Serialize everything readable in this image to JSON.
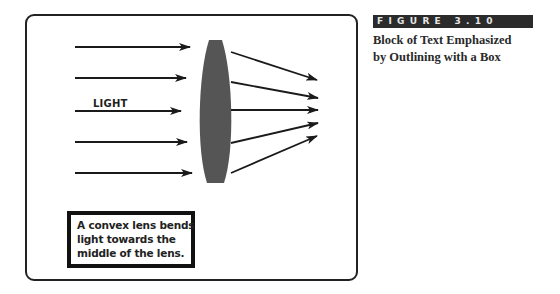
{
  "figure": {
    "label": "FIGURE 3.10",
    "title_lines": [
      "Block of Text Emphasized",
      "by Outlining with a Box"
    ]
  },
  "diagram": {
    "incoming_label": "LIGHT",
    "caption_lines": [
      "A convex lens bends",
      "light towards the",
      "middle of the lens."
    ],
    "colors": {
      "frame": "#222222",
      "lens": "#555555",
      "arrow": "#1a1a1a",
      "label_bar": "#2b2b2b"
    },
    "incoming_rays": [
      {
        "x1": 75,
        "y": 47,
        "x2": 190
      },
      {
        "x1": 75,
        "y": 78,
        "x2": 186
      },
      {
        "x1": 75,
        "y": 111,
        "x2": 181
      },
      {
        "x1": 75,
        "y": 142,
        "x2": 187
      },
      {
        "x1": 75,
        "y": 173,
        "x2": 192
      }
    ],
    "outgoing_rays": [
      {
        "x1": 231,
        "y1": 52,
        "x2": 317,
        "y2": 80
      },
      {
        "x1": 231,
        "y1": 82,
        "x2": 318,
        "y2": 98
      },
      {
        "x1": 231,
        "y1": 110,
        "x2": 318,
        "y2": 110
      },
      {
        "x1": 231,
        "y1": 143,
        "x2": 318,
        "y2": 123
      },
      {
        "x1": 231,
        "y1": 173,
        "x2": 317,
        "y2": 136
      }
    ]
  }
}
